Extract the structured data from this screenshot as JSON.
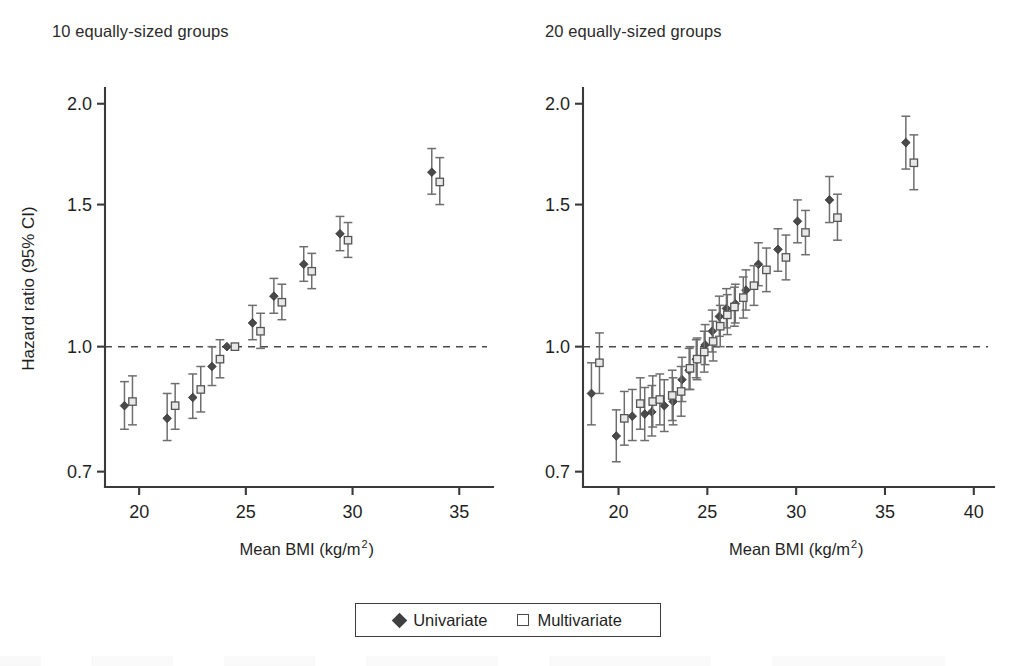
{
  "figure": {
    "shared_ylabel": "Hazard ratio (95% CI)",
    "shared_xlabel_main": "Mean BMI (kg/m",
    "shared_xlabel_sup": "2",
    "shared_xlabel_tail": ")"
  },
  "legend": {
    "univariate_label": "Univariate",
    "multivariate_label": "Multivariate",
    "univariate_marker": "filled-diamond-icon",
    "multivariate_marker": "open-square-icon"
  },
  "chart_data": [
    {
      "type": "scatter",
      "title": "10 equally-sized groups",
      "xlabel": "Mean BMI (kg/m2)",
      "ylabel": "Hazard ratio (95% CI)",
      "yscale": "log",
      "ylim": [
        0.67,
        2.08
      ],
      "xlim": [
        18.4,
        36.3
      ],
      "yticks": [
        0.7,
        1.0,
        1.5,
        2.0
      ],
      "ytick_labels": [
        "0.7",
        "1.0",
        "1.5",
        "2.0"
      ],
      "xticks": [
        20,
        25,
        30,
        35
      ],
      "xtick_labels": [
        "20",
        "25",
        "30",
        "35"
      ],
      "grid": false,
      "reference_line": 1.0,
      "x": [
        19.5,
        21.5,
        22.7,
        23.6,
        24.3,
        25.5,
        26.5,
        27.9,
        29.6,
        33.9
      ],
      "series": [
        {
          "name": "Univariate",
          "values": [
            0.845,
            0.815,
            0.865,
            0.945,
            1.0,
            1.07,
            1.155,
            1.265,
            1.38,
            1.645
          ],
          "lower": [
            0.79,
            0.765,
            0.815,
            0.895,
            1.0,
            1.02,
            1.1,
            1.205,
            1.315,
            1.545
          ],
          "upper": [
            0.905,
            0.875,
            0.925,
            1.0,
            1.0,
            1.125,
            1.215,
            1.33,
            1.45,
            1.76
          ]
        },
        {
          "name": "Multivariate",
          "values": [
            0.855,
            0.845,
            0.885,
            0.965,
            1.0,
            1.045,
            1.135,
            1.24,
            1.355,
            1.6
          ],
          "lower": [
            0.8,
            0.79,
            0.83,
            0.915,
            1.0,
            0.995,
            1.08,
            1.18,
            1.29,
            1.5
          ],
          "upper": [
            0.92,
            0.9,
            0.945,
            1.02,
            1.0,
            1.1,
            1.195,
            1.305,
            1.425,
            1.715
          ]
        }
      ]
    },
    {
      "type": "scatter",
      "title": "20 equally-sized groups",
      "xlabel": "Mean BMI (kg/m2)",
      "ylabel": "Hazard ratio (95% CI)",
      "yscale": "log",
      "ylim": [
        0.67,
        2.08
      ],
      "xlim": [
        18.0,
        40.8
      ],
      "yticks": [
        0.7,
        1.0,
        1.5,
        2.0
      ],
      "ytick_labels": [
        "0.7",
        "1.0",
        "1.5",
        "2.0"
      ],
      "xticks": [
        20,
        25,
        30,
        35,
        40
      ],
      "xtick_labels": [
        "20",
        "25",
        "30",
        "35",
        "40"
      ],
      "grid": false,
      "reference_line": 1.0,
      "x": [
        18.7,
        20.1,
        21.0,
        21.7,
        22.1,
        22.8,
        23.3,
        23.8,
        24.2,
        24.6,
        25.1,
        25.5,
        25.9,
        26.3,
        26.8,
        27.4,
        28.1,
        29.2,
        30.3,
        32.1,
        36.4
      ],
      "series": [
        {
          "name": "Univariate",
          "values": [
            0.875,
            0.775,
            0.82,
            0.825,
            0.83,
            0.845,
            0.855,
            0.91,
            0.935,
            0.965,
            1.005,
            1.045,
            1.09,
            1.115,
            1.13,
            1.175,
            1.265,
            1.32,
            1.43,
            1.52,
            1.79
          ],
          "lower": [
            0.8,
            0.72,
            0.765,
            0.765,
            0.775,
            0.785,
            0.8,
            0.855,
            0.885,
            0.915,
            0.95,
            0.985,
            1.03,
            1.055,
            1.07,
            1.11,
            1.19,
            1.24,
            1.345,
            1.425,
            1.66
          ],
          "upper": [
            0.955,
            0.835,
            0.885,
            0.89,
            0.895,
            0.91,
            0.915,
            0.97,
            0.995,
            1.02,
            1.065,
            1.11,
            1.155,
            1.18,
            1.195,
            1.245,
            1.345,
            1.4,
            1.52,
            1.625,
            1.93
          ]
        },
        {
          "name": "Multivariate",
          "values": [
            0.955,
            0.815,
            0.85,
            0.855,
            0.86,
            0.87,
            0.88,
            0.94,
            0.965,
            0.985,
            1.015,
            1.06,
            1.095,
            1.12,
            1.15,
            1.19,
            1.245,
            1.29,
            1.385,
            1.445,
            1.69
          ],
          "lower": [
            0.875,
            0.755,
            0.79,
            0.795,
            0.8,
            0.81,
            0.82,
            0.885,
            0.91,
            0.93,
            0.96,
            1.0,
            1.035,
            1.06,
            1.085,
            1.125,
            1.17,
            1.21,
            1.3,
            1.355,
            1.565
          ],
          "upper": [
            1.04,
            0.88,
            0.915,
            0.92,
            0.925,
            0.935,
            0.945,
            1.0,
            1.025,
            1.045,
            1.075,
            1.125,
            1.16,
            1.185,
            1.22,
            1.26,
            1.325,
            1.375,
            1.475,
            1.545,
            1.83
          ]
        }
      ]
    }
  ]
}
